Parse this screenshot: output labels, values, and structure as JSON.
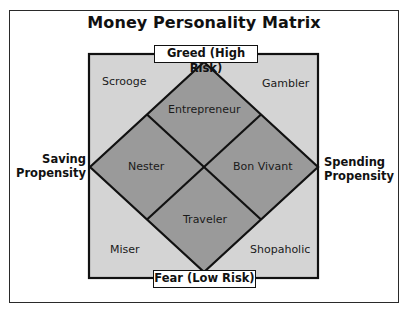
{
  "title": "Money Personality Matrix",
  "axes": {
    "top": "Greed (High Risk)",
    "bottom": "Fear (Low Risk)",
    "left_line1": "Saving",
    "left_line2": "Propensity",
    "right_line1": "Spending",
    "right_line2": "Propensity"
  },
  "corners": {
    "top_left": "Scrooge",
    "top_right": "Gambler",
    "bottom_left": "Miser",
    "bottom_right": "Shopaholic"
  },
  "diamond_cells": {
    "top": "Entrepreneur",
    "left": "Nester",
    "right": "Bon Vivant",
    "bottom": "Traveler"
  },
  "colors": {
    "outer_square_fill": "#d4d4d4",
    "diamond_fill": "#9a9a9a",
    "lines": "#111111"
  }
}
